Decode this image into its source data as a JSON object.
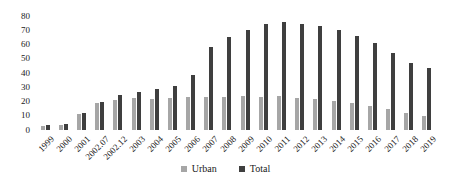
{
  "chart_data": {
    "type": "bar",
    "title": "",
    "xlabel": "",
    "ylabel": "",
    "categories": [
      "1999",
      "2000",
      "2001",
      "2002.07",
      "2002.12",
      "2003",
      "2004",
      "2005",
      "2006",
      "2007",
      "2008",
      "2009",
      "2010",
      "2011",
      "2012",
      "2013",
      "2014",
      "2015",
      "2016",
      "2017",
      "2018",
      "2019"
    ],
    "series": [
      {
        "name": "Urban",
        "color": "#a6a6a6",
        "values": [
          3,
          3.5,
          11.5,
          19,
          21,
          22.5,
          22,
          22.5,
          23,
          23.5,
          23.5,
          24,
          23.5,
          24,
          22.5,
          21.5,
          20.5,
          19,
          16.5,
          14.5,
          12,
          10
        ]
      },
      {
        "name": "Total",
        "color": "#3f3f3f",
        "values": [
          3.5,
          4.5,
          12,
          19.5,
          24.5,
          26.5,
          28.5,
          31,
          38.5,
          58,
          65,
          70,
          74.5,
          75.5,
          74.5,
          73,
          70.5,
          66,
          61,
          54,
          47,
          43.5
        ]
      }
    ],
    "ylim": [
      0,
      80
    ],
    "yticks": [
      0,
      10,
      20,
      30,
      40,
      50,
      60,
      70,
      80
    ],
    "grid": false,
    "axis_lines": false,
    "legend_position": "bottom-center",
    "text_color": "#1a1a1a",
    "background_color": "#ffffff"
  }
}
